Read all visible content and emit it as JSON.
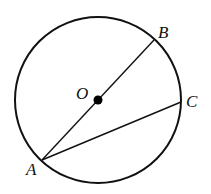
{
  "diagram": {
    "stroke_color": "#111111",
    "background": "#ffffff",
    "circle": {
      "cx": 98,
      "cy": 100,
      "r": 83
    },
    "points": {
      "O": {
        "label": "O",
        "x": 98,
        "y": 100,
        "label_x": 76,
        "label_y": 99
      },
      "A": {
        "label": "A",
        "x": 42,
        "y": 160,
        "label_x": 26,
        "label_y": 175
      },
      "B": {
        "label": "B",
        "x": 154,
        "y": 40,
        "label_x": 158,
        "label_y": 38
      },
      "C": {
        "label": "C",
        "x": 181,
        "y": 102,
        "label_x": 186,
        "label_y": 107
      }
    },
    "segments": [
      {
        "name": "AB",
        "from": "A",
        "to": "B"
      },
      {
        "name": "AC",
        "from": "A",
        "to": "C"
      }
    ]
  }
}
